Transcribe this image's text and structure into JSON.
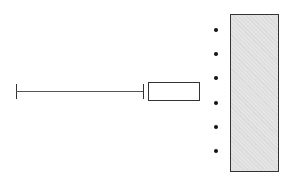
{
  "diagram": {
    "line": {
      "x1": 16,
      "x2": 143,
      "y": 91,
      "color": "#555555"
    },
    "small_box": {
      "x": 148,
      "y": 82,
      "width": 52,
      "height": 19,
      "fill": "#ffffff",
      "stroke": "#333333"
    },
    "tall_box": {
      "x": 230,
      "y": 14,
      "width": 49,
      "height": 158,
      "fill": "#e4e4e4",
      "stroke": "#333333"
    },
    "dots": {
      "x": 216,
      "y": [
        30,
        54,
        78,
        103,
        127,
        151
      ],
      "color": "#111111"
    }
  }
}
